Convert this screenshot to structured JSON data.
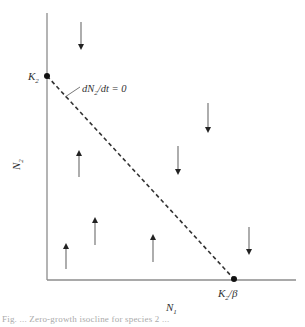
{
  "diagram": {
    "type": "phase-plane",
    "axes": {
      "x_label": "N",
      "x_label_sub": "1",
      "y_label": "N",
      "y_label_sub": "2",
      "color": "#8c8c8c"
    },
    "isocline": {
      "label": "dN₂/dt = 0",
      "label_parts": {
        "d": "d",
        "N": "N",
        "sub": "2",
        "rest": "/dt = 0"
      },
      "style": "dashed",
      "color": "#333333"
    },
    "points": [
      {
        "name": "K2",
        "label": "K",
        "sub": "2",
        "suffix": ""
      },
      {
        "name": "K2-over-beta",
        "label": "K",
        "sub": "2",
        "suffix": "/β"
      }
    ],
    "arrows": [
      {
        "direction": "down",
        "x": 81,
        "y1": 22,
        "y2": 50
      },
      {
        "direction": "down",
        "x": 208,
        "y1": 103,
        "y2": 133
      },
      {
        "direction": "down",
        "x": 178,
        "y1": 146,
        "y2": 175
      },
      {
        "direction": "down",
        "x": 249,
        "y1": 227,
        "y2": 255
      },
      {
        "direction": "up",
        "x": 79,
        "y1": 177,
        "y2": 150
      },
      {
        "direction": "up",
        "x": 95,
        "y1": 245,
        "y2": 217
      },
      {
        "direction": "up",
        "x": 66,
        "y1": 269,
        "y2": 243
      },
      {
        "direction": "up",
        "x": 153,
        "y1": 262,
        "y2": 234
      }
    ],
    "arrow_color": "#777777",
    "arrowhead_color": "#222222"
  },
  "caption": {
    "text": "Fig. ... Zero-growth isocline for species 2 ..."
  }
}
